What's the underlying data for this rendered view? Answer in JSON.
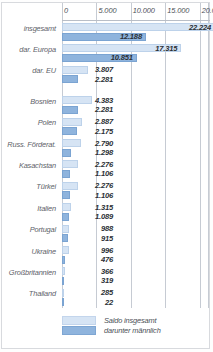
{
  "chart_data": {
    "type": "bar",
    "title": "",
    "xlabel": "",
    "ylabel": "",
    "orientation": "horizontal",
    "xlim": [
      0,
      21500
    ],
    "grid": true,
    "grid_axis": "x",
    "axis_ticks": [
      "0",
      "5.000",
      "10.000",
      "15.000",
      "20.000"
    ],
    "axis_tick_values": [
      0,
      5000,
      10000,
      15000,
      20000
    ],
    "legend_position": "bottom",
    "categories": [
      "insgesamt",
      "dar. Europa",
      "dar. EU",
      "Bosnien",
      "Polen",
      "Russ. Förderat.",
      "Kasachstan",
      "Türkei",
      "Italien",
      "Portugal",
      "Ukraine",
      "Großbritannien",
      "Thailand"
    ],
    "series": [
      {
        "name": "Saldo insgesamt",
        "color": "#d6e4f4",
        "values": [
          22224,
          17315,
          3807,
          4383,
          2887,
          2790,
          2276,
          2276,
          1315,
          988,
          996,
          366,
          285
        ],
        "labels": [
          "22.224",
          "17.315",
          "3.807",
          "4.383",
          "2.887",
          "2.790",
          "2.276",
          "2.276",
          "1.315",
          "988",
          "996",
          "366",
          "285"
        ]
      },
      {
        "name": "darunter männlich",
        "color": "#8fb4dd",
        "values": [
          12188,
          10851,
          2281,
          2281,
          2175,
          1298,
          1106,
          1106,
          1089,
          915,
          476,
          319,
          22
        ],
        "labels": [
          "12.188",
          "10.851",
          "2.281",
          "2.281",
          "2.175",
          "1.298",
          "1.106",
          "1.106",
          "1.089",
          "915",
          "476",
          "319",
          "22"
        ]
      }
    ]
  },
  "legend": {
    "total_label": "Saldo insgesamt",
    "male_label": "darunter männlich"
  }
}
